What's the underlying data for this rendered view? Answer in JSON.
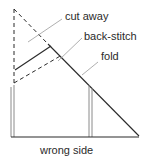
{
  "diagram": {
    "labels": {
      "cut_away": "cut away",
      "back_stitch": "back-stitch",
      "fold": "fold",
      "wrong_side": "wrong side"
    },
    "colors": {
      "line": "#2a2a2a",
      "leader": "#9a9a9a",
      "double_line": "#8a8a8a"
    }
  }
}
